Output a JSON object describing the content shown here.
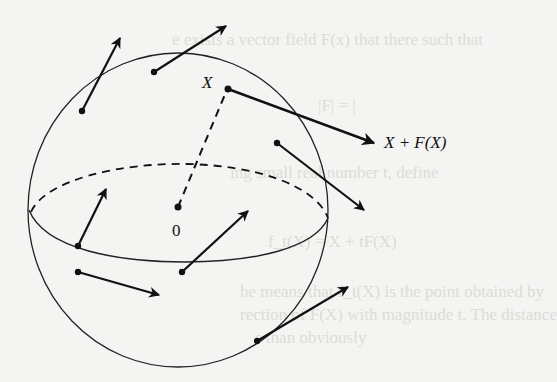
{
  "figure": {
    "labels": {
      "point_x": "X",
      "image_point": "X + F(X)",
      "origin": "0"
    },
    "background_text": [
      "e exists a vector field F(x) that there such that",
      "|F| = |",
      "ing small real number t, define",
      "f_t(X) = X + tF(X)",
      "he means that f_t(X) is the point obtained by",
      "rection of F(X) with magnitude t. The distance",
      "s than obviously"
    ],
    "colors": {
      "ink": "#111111",
      "paper": "#f4f4f2",
      "ghost_text": "#dcdcd8"
    }
  }
}
